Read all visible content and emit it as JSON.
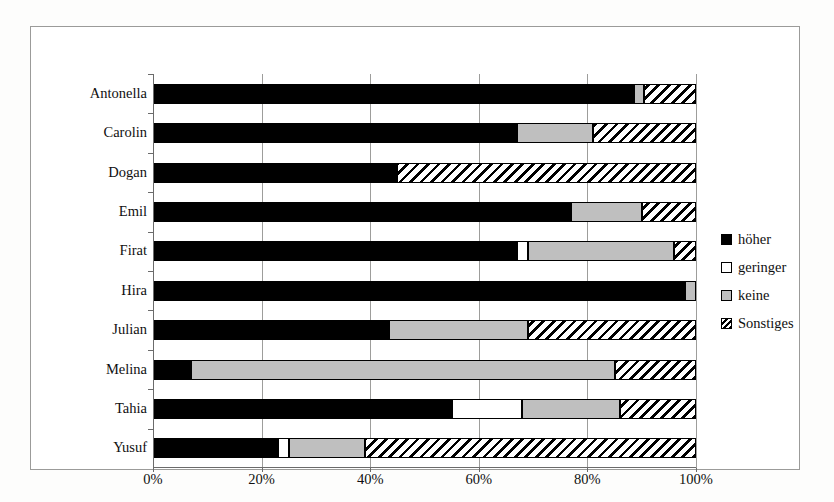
{
  "chart_data": {
    "type": "bar",
    "orientation": "horizontal",
    "stacked": true,
    "stack_mode": "percent",
    "title": "",
    "xlabel": "",
    "ylabel": "",
    "xlim": [
      0,
      100
    ],
    "xticks": [
      0,
      20,
      40,
      60,
      80,
      100
    ],
    "xticklabels": [
      "0%",
      "20%",
      "40%",
      "60%",
      "80%",
      "100%"
    ],
    "grid": "vertical",
    "legend_position": "right",
    "categories": [
      "Antonella",
      "Carolin",
      "Dogan",
      "Emil",
      "Firat",
      "Hira",
      "Julian",
      "Melina",
      "Tahia",
      "Yusuf"
    ],
    "series": [
      {
        "name": "höher",
        "color": "#000000",
        "pattern": "solid",
        "values": [
          88.5,
          67.0,
          45.0,
          77.0,
          67.0,
          98.0,
          43.5,
          7.0,
          55.0,
          23.0
        ]
      },
      {
        "name": "geringer",
        "color": "#ffffff",
        "pattern": "empty",
        "values": [
          0.0,
          0.0,
          0.0,
          0.0,
          2.0,
          0.0,
          0.0,
          0.0,
          13.0,
          2.0
        ]
      },
      {
        "name": "keine",
        "color": "#bfbfbf",
        "pattern": "solid",
        "values": [
          2.0,
          14.0,
          0.0,
          13.0,
          27.0,
          2.0,
          25.5,
          78.0,
          18.0,
          14.0
        ]
      },
      {
        "name": "Sonstiges",
        "color": "#ffffff",
        "pattern": "diagonal-hatch",
        "values": [
          9.5,
          19.0,
          55.0,
          10.0,
          4.0,
          0.0,
          31.0,
          15.0,
          14.0,
          61.0
        ]
      }
    ]
  },
  "legend": {
    "items": [
      {
        "label": "höher",
        "key": "key-hoeher"
      },
      {
        "label": "geringer",
        "key": "key-geringer"
      },
      {
        "label": "keine",
        "key": "key-keine"
      },
      {
        "label": "Sonstiges",
        "key": "key-sonstiges"
      }
    ]
  }
}
